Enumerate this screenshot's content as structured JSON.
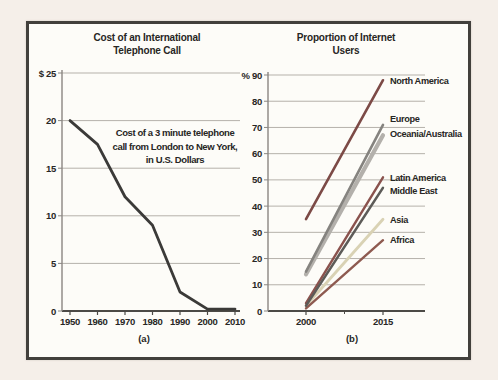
{
  "figure": {
    "colors": {
      "page_bg": "#f5efe9",
      "frame_border": "#42403c",
      "frame_bg": "#fdfcf8",
      "grid": "#b5b1aa",
      "axis": "#8a8682",
      "axis_dark": "#4c4a46",
      "text": "#272624"
    }
  },
  "chart_data": [
    {
      "id": "a",
      "type": "line",
      "title_lines": [
        "Cost of an International",
        "Telephone Call"
      ],
      "annotation_lines": [
        "Cost of a 3 minute telephone",
        "call from London to New York,",
        "in U.S. Dollars"
      ],
      "categories": [
        "1950",
        "1960",
        "1970",
        "1980",
        "1990",
        "2000",
        "2010"
      ],
      "series": [
        {
          "name": "Cost of a 3 minute call, London to New York",
          "values": [
            20,
            17.5,
            12,
            9,
            2,
            0.2,
            0.2
          ],
          "color": "#3b3a38",
          "width": 2.8
        }
      ],
      "ylim": [
        0,
        25
      ],
      "yticks": [
        {
          "v": 25,
          "label": "$ 25"
        },
        {
          "v": 20,
          "label": "20"
        },
        {
          "v": 15,
          "label": "15"
        },
        {
          "v": 10,
          "label": "10"
        },
        {
          "v": 5,
          "label": "5"
        },
        {
          "v": 0,
          "label": "0"
        }
      ],
      "grid": true,
      "caption": "(a)"
    },
    {
      "id": "b",
      "type": "line",
      "title_lines": [
        "Proportion of Internet",
        "Users"
      ],
      "categories": [
        "2000",
        "2015"
      ],
      "series": [
        {
          "name": "North America",
          "values": [
            35,
            88
          ],
          "color": "#7c4a46",
          "width": 2.6,
          "label_dy": 4
        },
        {
          "name": "Europe",
          "values": [
            15,
            71
          ],
          "color": "#85837f",
          "width": 2.6,
          "label_dy": -3
        },
        {
          "name": "Oceania/Australia",
          "values": [
            14,
            67
          ],
          "color": "#b3b0ab",
          "width": 4.2,
          "label_dy": 2
        },
        {
          "name": "Latin America",
          "values": [
            3,
            51
          ],
          "color": "#8a524d",
          "width": 2.4,
          "label_dy": 4
        },
        {
          "name": "Middle East",
          "values": [
            2,
            47
          ],
          "color": "#5d5b58",
          "width": 2.4,
          "label_dy": 6
        },
        {
          "name": "Asia",
          "values": [
            2,
            35
          ],
          "color": "#d9d2b4",
          "width": 2.8,
          "label_dy": 4
        },
        {
          "name": "Africa",
          "values": [
            1,
            27
          ],
          "color": "#8e5a50",
          "width": 2.4,
          "label_dy": 3
        }
      ],
      "ylim": [
        0,
        90
      ],
      "yticks": [
        {
          "v": 90,
          "label": "% 90"
        },
        {
          "v": 80,
          "label": "80"
        },
        {
          "v": 70,
          "label": "70"
        },
        {
          "v": 60,
          "label": "60"
        },
        {
          "v": 50,
          "label": "50"
        },
        {
          "v": 40,
          "label": "40"
        },
        {
          "v": 30,
          "label": "30"
        },
        {
          "v": 20,
          "label": "20"
        },
        {
          "v": 10,
          "label": "10"
        },
        {
          "v": 0,
          "label": "0"
        }
      ],
      "grid": true,
      "caption": "(b)"
    }
  ]
}
